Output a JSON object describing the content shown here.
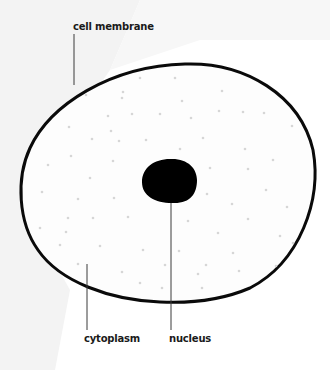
{
  "diagram": {
    "colors": {
      "background": "#ffffff",
      "background_shade": "#f2f2f2",
      "membrane_stroke": "#0a0a0a",
      "cytoplasm_fill": "#fdfdfd",
      "nucleus_fill": "#000000",
      "dots": "#d6d6d6",
      "leader_lines": "#3a3a3a",
      "label_text": "#1a1a1a"
    },
    "labels": {
      "cell_membrane": "cell membrane",
      "cytoplasm": "cytoplasm",
      "nucleus": "nucleus"
    }
  }
}
